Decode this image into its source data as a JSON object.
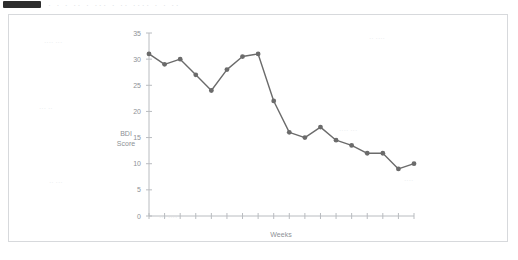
{
  "header": {
    "block_icon": "redacted-block-icon",
    "text": "· · ·   ··  · ···  · ··   ····  · ·   ··"
  },
  "chart_data": {
    "type": "line",
    "title": "",
    "xlabel": "Weeks",
    "ylabel": "BDI Score",
    "ylabel_lines": [
      "BDI",
      "Score"
    ],
    "ylim": [
      0,
      35
    ],
    "yticks": [
      0,
      5,
      10,
      15,
      20,
      25,
      30,
      35
    ],
    "ytick_labels": [
      "0",
      "5",
      "10",
      "15",
      "20",
      "25",
      "30",
      "35"
    ],
    "xlim": [
      1,
      18
    ],
    "x": [
      1,
      2,
      3,
      4,
      5,
      6,
      7,
      8,
      9,
      10,
      11,
      12,
      13,
      14,
      15,
      16,
      17,
      18
    ],
    "xtick_labels": [
      "",
      "",
      "",
      "",
      "",
      "",
      "",
      "",
      "",
      "",
      "",
      "",
      "",
      "",
      "",
      "",
      "",
      ""
    ],
    "values": [
      31,
      29,
      30,
      27,
      24,
      28,
      30.5,
      31,
      22,
      16,
      15,
      17,
      14.5,
      13.5,
      12,
      12,
      9,
      10
    ],
    "grid": false,
    "legend": false,
    "marker": "circle",
    "line_color": "#6b6b6b",
    "marker_color": "#6b6b6b",
    "axis_color": "#b9bcc0",
    "background": "#ffffff"
  },
  "ghost_text": {
    "items": [
      {
        "text": "···· ···",
        "x": 35,
        "y": 30
      },
      {
        "text": "·· ····",
        "x": 360,
        "y": 26
      },
      {
        "text": "··· ··",
        "x": 30,
        "y": 96
      },
      {
        "text": "···· ···",
        "x": 330,
        "y": 118
      },
      {
        "text": "·· ···",
        "x": 40,
        "y": 170
      },
      {
        "text": "····",
        "x": 395,
        "y": 168
      },
      {
        "text": "··· ····",
        "x": 150,
        "y": 205
      }
    ]
  }
}
